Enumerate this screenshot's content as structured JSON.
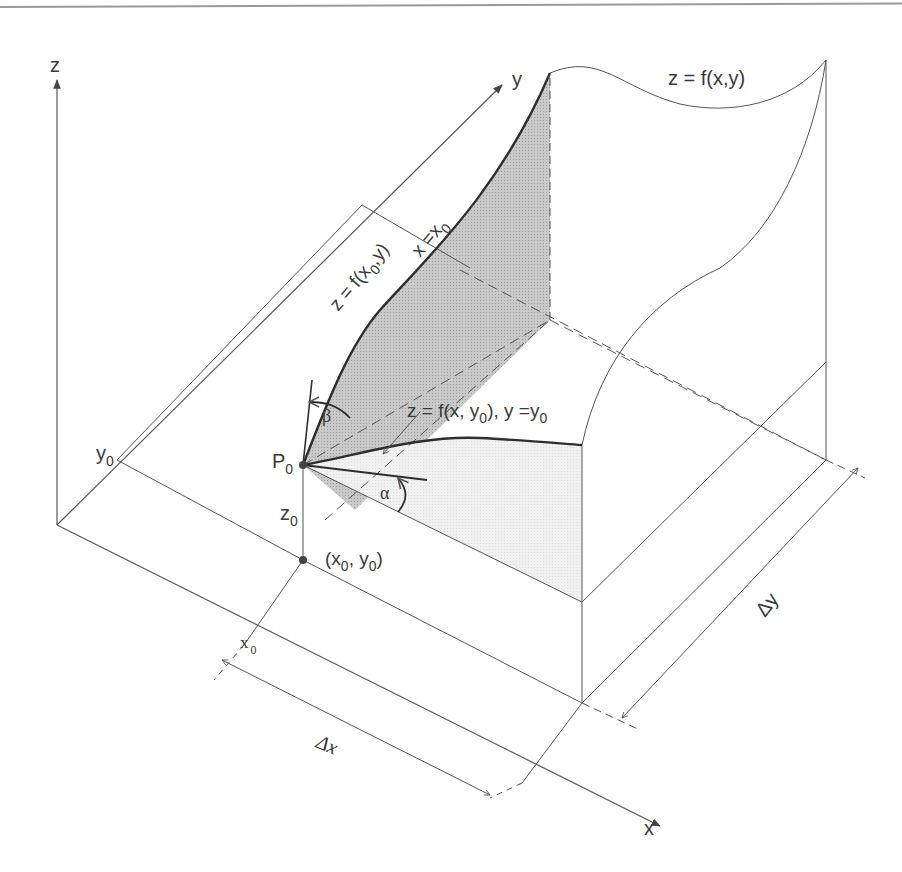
{
  "figure": {
    "type": "3d-partial-derivative-geometry",
    "colors": {
      "line": "#555555",
      "bold_line": "#2e2e2e",
      "shade_dark": "#bdbdbd",
      "shade_light": "#ececec",
      "text": "#3a3a3a"
    },
    "axes": {
      "z": "z",
      "y": "y",
      "x": "x"
    },
    "labels": {
      "surface": "z = f(x,y)",
      "curve_x0": "z = f(x",
      "curve_x0_sub": "0",
      "curve_x0_tail": ",y)",
      "plane_x0": "x =x",
      "plane_x0_sub": "0",
      "curve_y0": "z = f(x, y",
      "curve_y0_sub": "0",
      "curve_y0_mid": "), y =y",
      "curve_y0_sub2": "0",
      "point": "P",
      "point_sub": "0",
      "height": "z",
      "height_sub": "0",
      "base_point": "(x",
      "base_point_sub1": "0",
      "base_point_mid": ", y",
      "base_point_sub2": "0",
      "base_point_tail": ")",
      "y0": "y",
      "y0_sub": "0",
      "x0": "x",
      "x0_sub": "0",
      "delta_x": "Δx",
      "delta_y": "Δy",
      "alpha": "α",
      "beta": "β"
    }
  }
}
